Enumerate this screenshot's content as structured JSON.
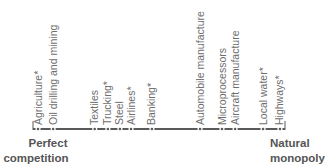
{
  "axis": {
    "left_end_label": [
      "Perfect",
      "competition"
    ],
    "right_end_label": [
      "Natural",
      "monopoly"
    ]
  },
  "industries": [
    {
      "label": "Agriculture*",
      "position": 0.02
    },
    {
      "label": "Oil drilling and mining",
      "position": 0.08
    },
    {
      "label": "Textiles",
      "position": 0.245
    },
    {
      "label": "Trucking*",
      "position": 0.297
    },
    {
      "label": "Steel",
      "position": 0.345
    },
    {
      "label": "Airlines*",
      "position": 0.389
    },
    {
      "label": "Banking*",
      "position": 0.472
    },
    {
      "label": "Automobile manufacture",
      "position": 0.663
    },
    {
      "label": "Microprocessors",
      "position": 0.75
    },
    {
      "label": "Aircraft manufacture",
      "position": 0.802
    },
    {
      "label": "Local water*",
      "position": 0.913
    },
    {
      "label": "Highways*",
      "position": 0.98
    }
  ],
  "colors": {
    "axis": "#5a5a5a",
    "label": "#6e6e6e",
    "end_label": "#555555"
  }
}
